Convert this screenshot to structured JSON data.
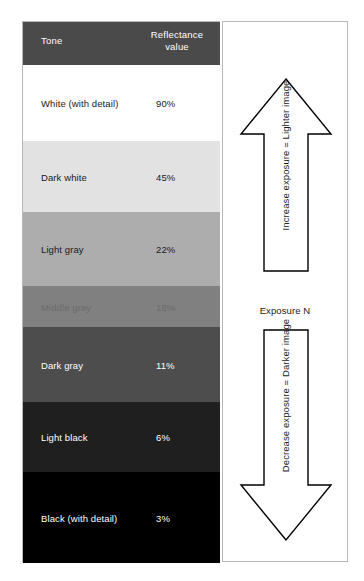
{
  "table": {
    "headers": {
      "tone": "Tone",
      "reflectance_line1": "Reflectance",
      "reflectance_line2": "value"
    },
    "header_bg": "#4a4a4a",
    "header_text_color": "#ffffff",
    "rows": [
      {
        "tone": "White (with detail)",
        "value": "90%",
        "swatch": "#ffffff",
        "text_color": "#1a1a1a",
        "height": 76
      },
      {
        "tone": "Dark white",
        "value": "45%",
        "swatch": "#e2e2e2",
        "text_color": "#1a1a1a",
        "height": 71
      },
      {
        "tone": "Light gray",
        "value": "22%",
        "swatch": "#adadad",
        "text_color": "#1a1a1a",
        "height": 74
      },
      {
        "tone": "Middle gray",
        "value": "18%",
        "swatch": "#808080",
        "text_color": "#6b6b6b",
        "height": 41
      },
      {
        "tone": "Dark gray",
        "value": "11%",
        "swatch": "#4d4d4d",
        "text_color": "#ffffff",
        "height": 75
      },
      {
        "tone": "Light black",
        "value": "6%",
        "swatch": "#1f1f1f",
        "text_color": "#ffffff",
        "height": 70
      },
      {
        "tone": "Black (with detail)",
        "value": "3%",
        "swatch": "#000000",
        "text_color": "#ffffff",
        "height": 91
      }
    ]
  },
  "exposure": {
    "up_arrow_caption": "Increase exposure = Lighter image",
    "down_arrow_caption": "Decrease exposure = Darker image",
    "midpoint_label": "Exposure N",
    "arrow_fill": "#ffffff",
    "arrow_stroke": "#000000"
  },
  "chart_data": {
    "type": "table",
    "columns": [
      "Tone",
      "Reflectance value"
    ],
    "categories": [
      "White (with detail)",
      "Dark white",
      "Light gray",
      "Middle gray",
      "Dark gray",
      "Light black",
      "Black (with detail)"
    ],
    "values": [
      90,
      45,
      22,
      18,
      11,
      6,
      3
    ],
    "value_unit": "%",
    "swatch_colors": [
      "#ffffff",
      "#e2e2e2",
      "#adadad",
      "#808080",
      "#4d4d4d",
      "#1f1f1f",
      "#000000"
    ],
    "annotations": [
      "Increase exposure = Lighter image",
      "Exposure N",
      "Decrease exposure = Darker image"
    ],
    "xlabel": "",
    "ylabel": "Reflectance value",
    "grid": false,
    "legend": "none"
  }
}
